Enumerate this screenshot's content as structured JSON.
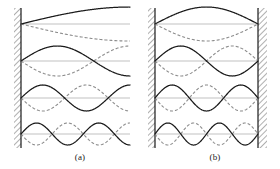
{
  "figure": {
    "width": 280,
    "height": 169,
    "background": "#ffffff",
    "stroke_solid": "#1a1a1a",
    "stroke_dashed": "#8c8c8c",
    "stroke_axis": "#a8a8a8",
    "wall_fill": "#ffffff",
    "wall_hatch": "#707070"
  },
  "panels": [
    {
      "id": "a",
      "caption": "(a)",
      "boundary": "fixed-free",
      "left_wall": true,
      "right_wall": false,
      "x_start": 21,
      "x_end": 130,
      "modes": [
        {
          "n": 1,
          "quarter_wavelengths": 1,
          "baseline_y": 24,
          "amplitude": 17
        },
        {
          "n": 2,
          "quarter_wavelengths": 3,
          "baseline_y": 61,
          "amplitude": 15
        },
        {
          "n": 3,
          "quarter_wavelengths": 5,
          "baseline_y": 98,
          "amplitude": 13
        },
        {
          "n": 4,
          "quarter_wavelengths": 7,
          "baseline_y": 134,
          "amplitude": 11
        }
      ]
    },
    {
      "id": "b",
      "caption": "(b)",
      "boundary": "fixed-fixed",
      "left_wall": true,
      "right_wall": true,
      "x_start": 155,
      "x_end": 258,
      "modes": [
        {
          "n": 1,
          "half_wavelengths": 1,
          "baseline_y": 24,
          "amplitude": 17
        },
        {
          "n": 2,
          "half_wavelengths": 2,
          "baseline_y": 61,
          "amplitude": 15
        },
        {
          "n": 3,
          "half_wavelengths": 3,
          "baseline_y": 98,
          "amplitude": 13
        },
        {
          "n": 4,
          "half_wavelengths": 4,
          "baseline_y": 134,
          "amplitude": 11
        }
      ]
    }
  ],
  "walls": [
    {
      "name": "panel-a-left-wall",
      "x": 14,
      "y": 8,
      "width": 7,
      "height": 140,
      "edge_side": "right"
    },
    {
      "name": "panel-b-left-wall",
      "x": 148,
      "y": 8,
      "width": 7,
      "height": 140,
      "edge_side": "right"
    },
    {
      "name": "panel-b-right-wall",
      "x": 258,
      "y": 8,
      "width": 9,
      "height": 140,
      "edge_side": "left"
    }
  ],
  "curves": {
    "solid_label": "displacement at phase 0",
    "dashed_label": "displacement at phase pi",
    "dash_pattern": "3,2"
  }
}
